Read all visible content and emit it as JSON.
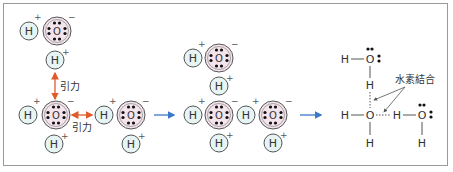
{
  "diagram": {
    "atoms": {
      "hydrogen": "H",
      "oxygen": "O",
      "plus": "+",
      "minus": "−"
    },
    "labels": {
      "attraction_1": "引力",
      "attraction_2": "引力",
      "hydrogen_bond": "水素結合"
    },
    "colors": {
      "h_fill": "#e6f4f4",
      "o_fill": "#f4e4ec",
      "attraction_arrow": "#e05a2a",
      "process_arrow": "#3a78c8",
      "line": "#555555",
      "text": "#333333"
    },
    "panels": [
      {
        "name": "attraction",
        "description": "Water molecules attract each other"
      },
      {
        "name": "aggregation",
        "description": "Water molecules gather"
      },
      {
        "name": "structural-formula",
        "description": "Hydrogen bonds between molecules"
      }
    ]
  }
}
